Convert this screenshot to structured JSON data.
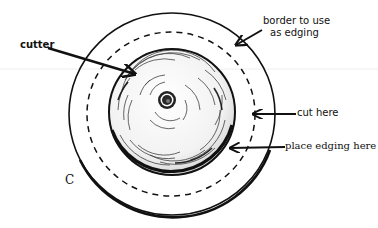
{
  "diagram": {
    "figure_letter": "C",
    "labels": {
      "cutter": "cutter",
      "border_line1": "border to use",
      "border_line2": "as edging",
      "cut_here": "cut here",
      "place_edging": "place edging here"
    },
    "colors": {
      "ink": "#111111",
      "background": "#ffffff"
    }
  }
}
